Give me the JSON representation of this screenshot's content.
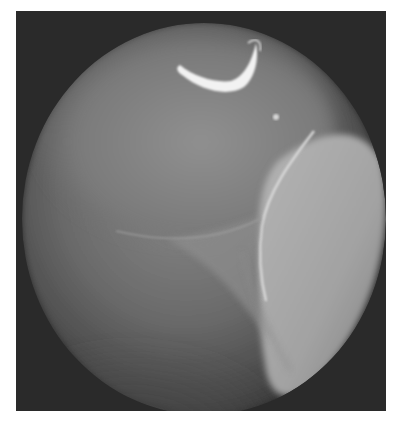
{
  "image": {
    "description": "Grayscale circular endoscopic view showing rounded tissue surfaces meeting at a central junction, with a bright crescent reflection near the top",
    "colors": {
      "background": "#ffffff",
      "frame": "#2b2b2b",
      "field_mid": "#6e6e6e",
      "field_dark": "#3a3a3a",
      "highlight": "#f4f4f4",
      "right_lobe": "#a8a8a8"
    },
    "elements": [
      "circular-field-of-view",
      "crescent-reflection",
      "small-bright-spot",
      "upper-left-rounded-surface",
      "right-bright-lobe",
      "central-junction",
      "lower-dark-region"
    ]
  }
}
